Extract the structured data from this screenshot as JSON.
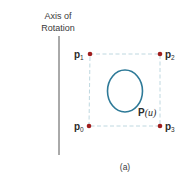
{
  "axis": {
    "label_line1": "Axis of",
    "label_line2": "Rotation"
  },
  "control_points": [
    {
      "name": "p",
      "sub": "0"
    },
    {
      "name": "p",
      "sub": "1"
    },
    {
      "name": "p",
      "sub": "2"
    },
    {
      "name": "p",
      "sub": "3"
    }
  ],
  "curve": {
    "label_main": "P",
    "label_param": "(u)"
  },
  "caption": "(a)",
  "colors": {
    "curve": "#2e7a98",
    "point": "#a01e1e",
    "dashed_polygon": "#b8d4dc",
    "axis": "#555555"
  }
}
